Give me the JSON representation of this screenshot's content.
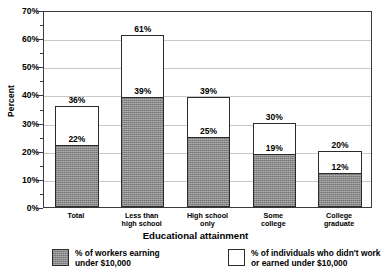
{
  "chart_data": {
    "type": "bar",
    "title": "",
    "subtitle": "",
    "xlabel": "Educational attainment",
    "ylabel": "Percent",
    "ylim": [
      0,
      70
    ],
    "ytick_labels": [
      "0%",
      "10%",
      "20%",
      "30%",
      "40%",
      "50%",
      "60%",
      "70%"
    ],
    "ytick_values": [
      0,
      10,
      20,
      30,
      40,
      50,
      60,
      70
    ],
    "minor_tick_values": [
      5,
      15,
      25,
      35,
      45,
      55,
      65
    ],
    "grid": true,
    "grid_axis": "y",
    "legend_position": "bottom",
    "categories": [
      "Total",
      "Less than high school",
      "High school only",
      "Some college",
      "College graduate"
    ],
    "category_tick_labels": [
      "Total",
      "Less than\nhigh school",
      "High school\nonly",
      "Some\ncollege",
      "College\ngraduate"
    ],
    "series": [
      {
        "name": "% of workers earning under $10,000",
        "style": "filled-gray",
        "values": [
          22,
          39,
          25,
          19,
          12
        ],
        "value_labels": [
          "22%",
          "39%",
          "25%",
          "19%",
          "12%"
        ]
      },
      {
        "name": "% of individuals who didn't work or earned under $10,000",
        "style": "white-outline",
        "values": [
          36,
          61,
          39,
          30,
          20
        ],
        "value_labels": [
          "36%",
          "61%",
          "39%",
          "30%",
          "20%"
        ]
      }
    ]
  },
  "legend": {
    "entries": [
      {
        "label": "% of workers earning\nunder $10,000",
        "swatch": "filled"
      },
      {
        "label": "% of individuals who didn't work\nor earned under $10,000",
        "swatch": "empty"
      }
    ]
  },
  "colors": {
    "bar_fill": "#8a8a8a",
    "bar_edge": "#2b2b2b",
    "gridline": "#c8c8c8",
    "axis": "#3a3a3a",
    "background": "#ffffff",
    "text": "#000000"
  }
}
